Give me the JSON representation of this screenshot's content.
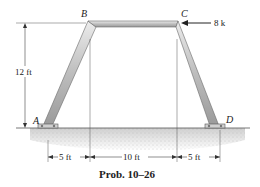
{
  "figure": {
    "type": "frame-diagram",
    "caption": "Prob. 10–26",
    "points": {
      "A": "A",
      "B": "B",
      "C": "C",
      "D": "D"
    },
    "load": {
      "label": "8 k",
      "at": "C",
      "direction": "left"
    },
    "dimensions": {
      "height": "12 ft",
      "left_span": "5 ft",
      "middle_span": "10 ft",
      "right_span": "5 ft"
    },
    "colors": {
      "beam_fill": "#c8c8c8",
      "beam_edge": "#6a6a6a",
      "ground": "#d6d6d6",
      "line": "#333333"
    }
  }
}
